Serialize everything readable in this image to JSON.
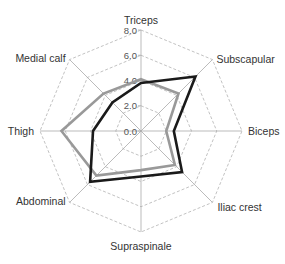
{
  "chart_data": {
    "type": "radar",
    "title": "",
    "categories": [
      "Triceps",
      "Subscapular",
      "Biceps",
      "Iliac crest",
      "Supraspinale",
      "Abdominal",
      "Thigh",
      "Medial calf"
    ],
    "series": [
      {
        "name": "Series 1 (black)",
        "color": "#1a1a1a",
        "values": [
          3.8,
          6.1,
          2.6,
          4.6,
          3.6,
          5.7,
          3.8,
          3.2
        ]
      },
      {
        "name": "Series 2 (gray)",
        "color": "#999999",
        "values": [
          4.1,
          4.2,
          2.0,
          3.8,
          3.1,
          5.0,
          6.3,
          4.2
        ]
      }
    ],
    "ticks": [
      "0.0",
      "2.0",
      "4.0",
      "6.0",
      "8.0"
    ],
    "tick_values": [
      0,
      2,
      4,
      6,
      8
    ],
    "rlim": [
      0,
      8
    ],
    "grid": true,
    "grid_style": "dashed",
    "legend": "none"
  },
  "colors": {
    "grid": "#bbbbbb",
    "axis": "#aaaaaa",
    "label": "#333333"
  }
}
